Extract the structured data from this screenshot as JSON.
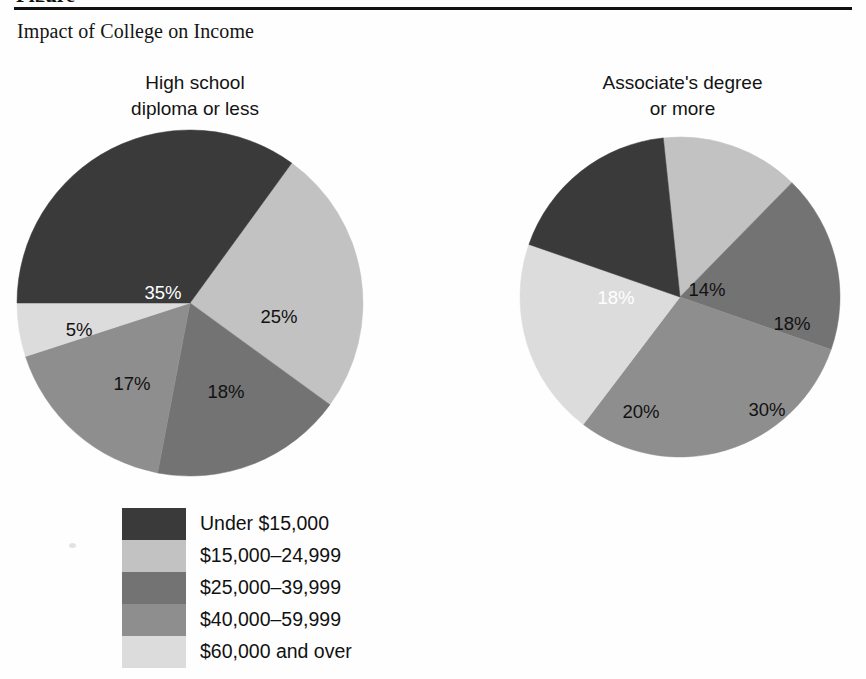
{
  "figure": {
    "header_cutoff": "Figure",
    "title": "Impact of College on Income"
  },
  "colors": {
    "under_15k": "#3a3a3a",
    "r15_24": "#c2c2c2",
    "r25_39": "#737373",
    "r40_59": "#8e8e8e",
    "over_60k": "#dcdcdc",
    "label_dark": "#111111",
    "label_light": "#ffffff",
    "background": "#fefefe"
  },
  "charts": {
    "left": {
      "title_line1": "High school",
      "title_line2": "diploma or less",
      "labels": [
        "35%",
        "25%",
        "18%",
        "17%",
        "5%"
      ]
    },
    "right": {
      "title_line1": "Associate's degree",
      "title_line2": "or more",
      "labels": [
        "14%",
        "18%",
        "30%",
        "20%",
        "18%"
      ]
    }
  },
  "legend": {
    "items": [
      {
        "label": "Under $15,000",
        "color": "#3a3a3a"
      },
      {
        "label": "$15,000–24,999",
        "color": "#c2c2c2"
      },
      {
        "label": "$25,000–39,999",
        "color": "#737373"
      },
      {
        "label": "$40,000–59,999",
        "color": "#8e8e8e"
      },
      {
        "label": "$60,000 and over",
        "color": "#dcdcdc"
      }
    ]
  },
  "chart_data": {
    "type": "pie",
    "title": "Impact of College on Income",
    "legend_position": "bottom-left",
    "categories": [
      "Under $15,000",
      "$15,000–24,999",
      "$25,000–39,999",
      "$40,000–59,999",
      "$60,000 and over"
    ],
    "category_colors": [
      "#3a3a3a",
      "#c2c2c2",
      "#737373",
      "#8e8e8e",
      "#dcdcdc"
    ],
    "series": [
      {
        "name": "High school diploma or less",
        "values": [
          35,
          25,
          18,
          17,
          5
        ],
        "value_labels": [
          "35%",
          "25%",
          "18%",
          "17%",
          "5%"
        ],
        "units": "percent"
      },
      {
        "name": "Associate's degree or more",
        "values": [
          18,
          14,
          18,
          30,
          20
        ],
        "value_labels": [
          "18%",
          "14%",
          "18%",
          "30%",
          "20%"
        ],
        "units": "percent"
      }
    ],
    "xlabel": "",
    "ylabel": "",
    "grid": false
  }
}
